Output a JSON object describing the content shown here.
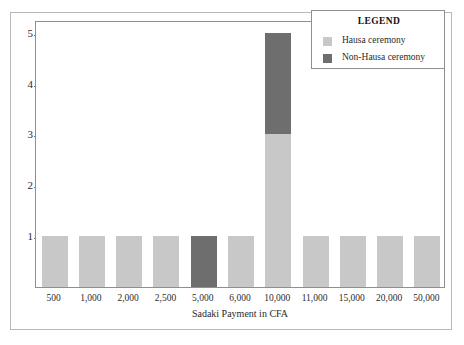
{
  "chart_data": {
    "type": "bar",
    "subtype": "stacked-bar",
    "title": "",
    "xlabel": "Sadaki Payment in CFA",
    "ylabel": "Number of Cases",
    "categories": [
      "500",
      "1,000",
      "2,000",
      "2,500",
      "5,000",
      "6,000",
      "10,000",
      "11,000",
      "15,000",
      "20,000",
      "50,000"
    ],
    "series": [
      {
        "name": "Hausa ceremony",
        "color": "#c8c8c8",
        "values": [
          1,
          1,
          1,
          1,
          0,
          1,
          3,
          1,
          1,
          1,
          1
        ]
      },
      {
        "name": "Non-Hausa ceremony",
        "color": "#6e6e6e",
        "values": [
          0,
          0,
          0,
          0,
          1,
          0,
          2,
          0,
          0,
          0,
          0
        ]
      }
    ],
    "totals": [
      1,
      1,
      1,
      1,
      1,
      1,
      5,
      1,
      1,
      1,
      1
    ],
    "ytick_labels": [
      "1",
      "2",
      "3",
      "4",
      "5"
    ],
    "ytick_values": [
      1,
      2,
      3,
      4,
      5
    ],
    "ylim": [
      0,
      5.25
    ],
    "grid": false,
    "legend_position": "top-right"
  },
  "legend": {
    "title": "LEGEND",
    "entries": [
      {
        "label": "Hausa ceremony",
        "color": "#c8c8c8"
      },
      {
        "label": "Non-Hausa ceremony",
        "color": "#6e6e6e"
      }
    ]
  },
  "colors": {
    "hausa": "#c8c8c8",
    "non_hausa": "#6e6e6e",
    "axis": "#8f8f8f",
    "frame": "#b9b9b9",
    "text": "#2b2b2b",
    "background": "#ffffff"
  }
}
